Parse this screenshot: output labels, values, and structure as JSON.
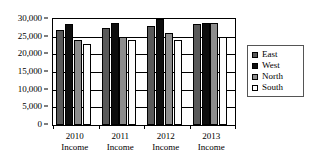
{
  "chart_data": {
    "type": "bar",
    "title": "",
    "subtitle": "",
    "xlabel": "",
    "ylabel": "",
    "categories": [
      "2010 Income",
      "2011 Income",
      "2012 Income",
      "2013 Income"
    ],
    "category_lines": [
      [
        "2010",
        "Income"
      ],
      [
        "2011",
        "Income"
      ],
      [
        "2012",
        "Income"
      ],
      [
        "2013",
        "Income"
      ]
    ],
    "series": [
      {
        "name": "East",
        "color": "#595959",
        "values": [
          27000,
          27500,
          28000,
          28500
        ]
      },
      {
        "name": "West",
        "color": "#0d0d0d",
        "values": [
          28500,
          29000,
          30000,
          29000
        ]
      },
      {
        "name": "North",
        "color": "#8c8c8c",
        "values": [
          24000,
          25000,
          26000,
          29000
        ]
      },
      {
        "name": "South",
        "color": "#ffffff",
        "values": [
          23000,
          24000,
          24000,
          25000
        ]
      }
    ],
    "ylim": [
      0,
      30000
    ],
    "ytick_values": [
      30000,
      25000,
      20000,
      15000,
      10000,
      5000,
      0
    ],
    "ytick_labels": [
      "30,000",
      "25,000",
      "20,000",
      "15,000",
      "10,000",
      "5,000",
      "0"
    ],
    "grid": true,
    "grid_axis": "y",
    "legend": {
      "position": "right",
      "entries": [
        {
          "label": "East",
          "color": "#595959"
        },
        {
          "label": "West",
          "color": "#0d0d0d"
        },
        {
          "label": "North",
          "color": "#8c8c8c"
        },
        {
          "label": "South",
          "color": "#ffffff"
        }
      ]
    },
    "plot_border": true,
    "background": "#ffffff"
  }
}
